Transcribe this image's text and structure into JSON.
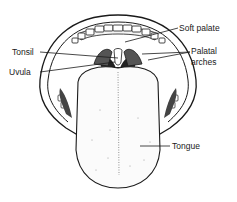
{
  "diagram": {
    "labels": {
      "soft_palate": "Soft palate",
      "tonsil": "Tonsil",
      "palatal_arches_line1": "Palatal",
      "palatal_arches_line2": "arches",
      "uvula": "Uvula",
      "tongue": "Tongue"
    },
    "colors": {
      "ink": "#1a1a1a",
      "shade": "#555555",
      "paper": "#ffffff"
    }
  }
}
